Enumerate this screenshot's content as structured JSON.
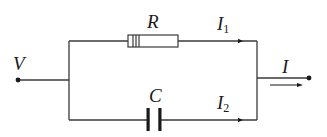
{
  "diagram": {
    "type": "RC parallel circuit",
    "colors": {
      "wire": "#3a3a3a",
      "background": "#ffffff"
    },
    "labels": {
      "voltage": "V",
      "resistor": "R",
      "capacitor": "C",
      "current_resistor": {
        "main": "I",
        "sub": "1"
      },
      "current_capacitor": {
        "main": "I",
        "sub": "2"
      },
      "current_total": "I"
    },
    "components": [
      {
        "name": "resistor",
        "symbol": "R",
        "branch": "top"
      },
      {
        "name": "capacitor",
        "symbol": "C",
        "branch": "bottom"
      }
    ],
    "terminals": [
      "input terminal V",
      "output terminal I"
    ]
  }
}
